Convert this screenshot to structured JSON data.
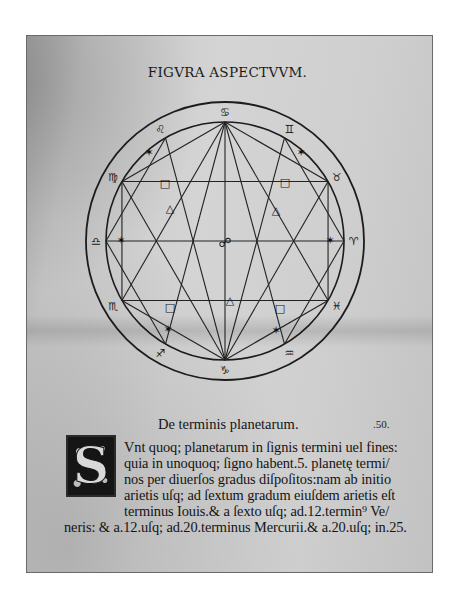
{
  "page": {
    "title": "FIGVRA ASPECTVVM.",
    "folio": ".50.",
    "colors": {
      "paper": "#cfcfcf",
      "ink": "#151515",
      "background": "#ffffff"
    }
  },
  "diagram": {
    "center_symbol": "☍",
    "zodiac": [
      {
        "sign": "cancer",
        "glyph": "♋",
        "angle": 0
      },
      {
        "sign": "gemini",
        "glyph": "♊",
        "angle": 30
      },
      {
        "sign": "taurus",
        "glyph": "♉",
        "angle": 60
      },
      {
        "sign": "aries",
        "glyph": "♈",
        "angle": 90
      },
      {
        "sign": "pisces",
        "glyph": "♓",
        "angle": 120
      },
      {
        "sign": "aquarius",
        "glyph": "♒",
        "angle": 150
      },
      {
        "sign": "capricorn",
        "glyph": "♑",
        "angle": 180
      },
      {
        "sign": "sagittarius",
        "glyph": "♐",
        "angle": 210
      },
      {
        "sign": "scorpio",
        "glyph": "♏",
        "angle": 240
      },
      {
        "sign": "libra",
        "glyph": "♎",
        "angle": 270
      },
      {
        "sign": "virgo",
        "glyph": "♍",
        "angle": 300
      },
      {
        "sign": "leo",
        "glyph": "♌",
        "angle": 330
      }
    ],
    "aspects": {
      "sextile": "✶",
      "square": "□",
      "trine": "△",
      "opposition": "☍"
    }
  },
  "text": {
    "heading": "De terminis planetarum.",
    "dropcap": "S",
    "lines": [
      "Vnt quoq; planetarum in ſignis termini uel fines:",
      "quia in unoquoq; ſigno habent.5. planetę termi/",
      "nos per diuerſos gradus diſpoſitos:nam ab initio",
      "arietis uſq; ad ſextum gradum eiuſdem arietis eſt",
      "terminus Iouis.& a ſexto uſq; ad.12.termin⁹ Ve/",
      "neris: & a.12.uſq; ad.20.terminus Mercurii.& a.20.uſq; in.25."
    ]
  }
}
